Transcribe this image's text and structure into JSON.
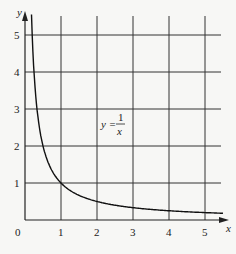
{
  "chart_data": {
    "type": "line",
    "title": "",
    "xlabel": "x",
    "ylabel": "y",
    "xlim": [
      0,
      5.5
    ],
    "ylim": [
      0,
      5.5
    ],
    "xticks": [
      "0",
      "1",
      "2",
      "3",
      "4",
      "5"
    ],
    "yticks": [
      "1",
      "2",
      "3",
      "4",
      "5"
    ],
    "grid": true,
    "series": [
      {
        "name": "y = 1/x",
        "x": [
          0.18,
          0.2,
          0.25,
          0.33,
          0.5,
          0.75,
          1,
          1.5,
          2,
          2.5,
          3,
          3.5,
          4,
          4.5,
          5,
          5.5
        ],
        "values": [
          5.5,
          5,
          4,
          3,
          2,
          1.33,
          1,
          0.67,
          0.5,
          0.4,
          0.33,
          0.29,
          0.25,
          0.22,
          0.2,
          0.18
        ]
      }
    ],
    "annotations": [
      {
        "text": "y = 1/x",
        "x": 2.6,
        "y": 2.5
      }
    ]
  },
  "labels": {
    "x_axis": "x",
    "y_axis": "y",
    "origin": "0",
    "eq_lhs": "y =",
    "eq_num": "1",
    "eq_den": "x"
  }
}
